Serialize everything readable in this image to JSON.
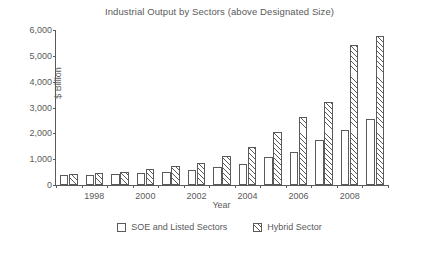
{
  "chart_data": {
    "type": "bar",
    "title": "Industrial Output by Sectors (above Designated Size)",
    "xlabel": "Year",
    "ylabel": "$ Billion",
    "categories": [
      "1997",
      "1998",
      "1999",
      "2000",
      "2001",
      "2002",
      "2003",
      "2004",
      "2005",
      "2006",
      "2007",
      "2008",
      "2009"
    ],
    "xtick_labels": [
      "1998",
      "2000",
      "2002",
      "2004",
      "2006",
      "2008"
    ],
    "ytick_labels": [
      "0",
      "1,000",
      "2,000",
      "3,000",
      "4,000",
      "5,000",
      "6,000"
    ],
    "ylim": [
      0,
      6000
    ],
    "grid": false,
    "legend_position": "bottom",
    "series": [
      {
        "name": "SOE and Listed Sectors",
        "fill": "white",
        "values": [
          380,
          400,
          420,
          470,
          520,
          600,
          700,
          830,
          1080,
          1270,
          1750,
          2130,
          2560
        ]
      },
      {
        "name": "Hybrid Sector",
        "fill": "hatched",
        "values": [
          430,
          470,
          520,
          620,
          720,
          870,
          1120,
          1470,
          2040,
          2620,
          3210,
          5420,
          5760
        ]
      }
    ]
  },
  "legend": {
    "items": [
      {
        "label": "SOE and Listed Sectors",
        "swatch": "white"
      },
      {
        "label": "Hybrid Sector",
        "swatch": "hatched"
      }
    ]
  }
}
